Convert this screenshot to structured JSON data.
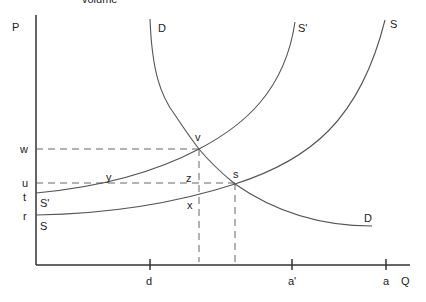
{
  "title_partial": "volume",
  "axes": {
    "y_label": "P",
    "x_label": "Q"
  },
  "price_levels": [
    {
      "label": "w",
      "y": 149
    },
    {
      "label": "u",
      "y": 183
    },
    {
      "label": "t",
      "y": 196
    },
    {
      "label": "r",
      "y": 216
    }
  ],
  "quantity_ticks": [
    {
      "label": "d",
      "x": 150
    },
    {
      "label": "a'",
      "x": 292
    },
    {
      "label": "a",
      "x": 386
    }
  ],
  "curves": {
    "D_top": "D",
    "D_bottom": "D",
    "S_prime_top": "S'",
    "S_top": "S",
    "S_prime_left": "S'",
    "S_left": "S"
  },
  "points": {
    "v": "v",
    "s": "s",
    "y": "y",
    "z": "z",
    "x": "x"
  },
  "colors": {
    "line": "#555555",
    "axis": "#333333",
    "dash": "#666666"
  }
}
